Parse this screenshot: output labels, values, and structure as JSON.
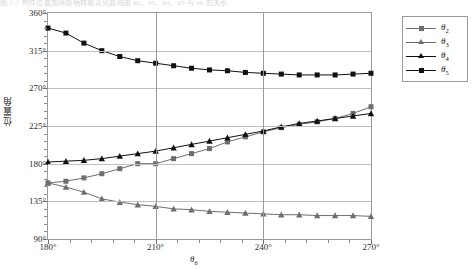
{
  "top_caption": "图 5-7  构件位置角随曲柄转角变化曲线图   θ2、θ3、θ4、θ5 与 θ6 的关系",
  "axes": {
    "y_title": "位置角",
    "x_title_html": "θ6",
    "y_ticks": [
      "90°",
      "135°",
      "180°",
      "225°",
      "270°",
      "315°",
      "360°"
    ],
    "x_ticks": [
      "180°",
      "210°",
      "240°",
      "270°"
    ]
  },
  "legend": {
    "items": [
      {
        "name": "theta2",
        "label": "θ",
        "sub": "2",
        "color": "#6e6e6e",
        "marker": "square"
      },
      {
        "name": "theta3",
        "label": "θ",
        "sub": "3",
        "color": "#6e6e6e",
        "marker": "triangle"
      },
      {
        "name": "theta4",
        "label": "θ",
        "sub": "4",
        "color": "#111111",
        "marker": "triangle"
      },
      {
        "name": "theta5",
        "label": "θ",
        "sub": "5",
        "color": "#111111",
        "marker": "square"
      }
    ]
  },
  "chart_data": {
    "type": "line",
    "title": "",
    "xlabel": "θ6",
    "ylabel": "位置角",
    "xlim": [
      180,
      270
    ],
    "ylim": [
      90,
      360
    ],
    "ygrid": true,
    "xgrid": true,
    "ytick_values": [
      90,
      135,
      180,
      225,
      270,
      315,
      360
    ],
    "xtick_values": [
      180,
      210,
      240,
      270
    ],
    "legend_position": "top-right",
    "x": [
      180,
      185,
      190,
      195,
      200,
      205,
      210,
      215,
      220,
      225,
      230,
      235,
      240,
      245,
      250,
      255,
      260,
      265,
      270
    ],
    "series": [
      {
        "name": "θ2",
        "color": "#6e6e6e",
        "marker": "square",
        "values": [
          157,
          159,
          163,
          168,
          174,
          180,
          180,
          186,
          192,
          198,
          206,
          212,
          218,
          223,
          227,
          230,
          234,
          240,
          248
        ]
      },
      {
        "name": "θ3",
        "color": "#6e6e6e",
        "marker": "triangle",
        "values": [
          157,
          152,
          146,
          138,
          134,
          131,
          129,
          126,
          125,
          123,
          122,
          121,
          120,
          119,
          119,
          118,
          118,
          118,
          117
        ]
      },
      {
        "name": "θ4",
        "color": "#111111",
        "marker": "triangle",
        "values": [
          182,
          183,
          184,
          186,
          189,
          192,
          195,
          199,
          203,
          207,
          211,
          215,
          219,
          224,
          228,
          231,
          234,
          237,
          240
        ]
      },
      {
        "name": "θ5",
        "color": "#111111",
        "marker": "square",
        "values": [
          342,
          336,
          324,
          315,
          308,
          303,
          300,
          297,
          294,
          292,
          291,
          289,
          288,
          287,
          286,
          286,
          286,
          287,
          288
        ]
      }
    ]
  }
}
